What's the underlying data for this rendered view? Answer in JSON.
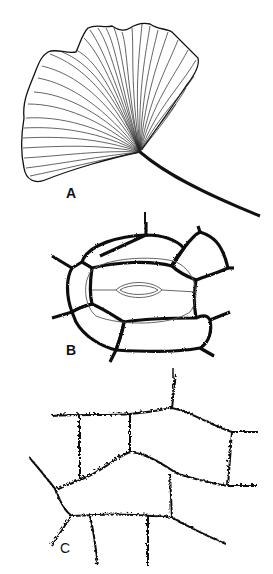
{
  "figure": {
    "panels": [
      {
        "id": "A",
        "label": "A",
        "subject": "ginkgo-leaf"
      },
      {
        "id": "B",
        "label": "B",
        "subject": "stoma-with-subsidiary-cells"
      },
      {
        "id": "C",
        "label": "C",
        "subject": "epidermal-cells-wavy-walls"
      }
    ]
  },
  "colors": {
    "ink": "#111111",
    "background": "#ffffff",
    "thin_line": "#555555"
  }
}
